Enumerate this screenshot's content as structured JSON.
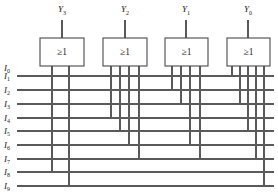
{
  "diagram": {
    "gate_symbol": "≥1",
    "wire_color": "#5a5a5a",
    "gate_border_color": "#4a4a4a",
    "background_color": "#ffffff",
    "outputs": [
      {
        "name": "Y3",
        "base": "Y",
        "sub": "3",
        "x": 62,
        "label_x": 62,
        "label_y": 12
      },
      {
        "name": "Y2",
        "base": "Y",
        "sub": "2",
        "x": 125,
        "label_x": 125,
        "label_y": 12
      },
      {
        "name": "Y1",
        "base": "Y",
        "sub": "1",
        "x": 186,
        "label_x": 186,
        "label_y": 12
      },
      {
        "name": "Y0",
        "base": "Y",
        "sub": "0",
        "x": 248,
        "label_x": 248,
        "label_y": 12
      }
    ],
    "inputs": [
      {
        "name": "I0",
        "base": "I",
        "sub": "0",
        "y": 68,
        "has_bus": false
      },
      {
        "name": "I1",
        "base": "I",
        "sub": "1",
        "y": 76,
        "has_bus": true
      },
      {
        "name": "I2",
        "base": "I",
        "sub": "2",
        "y": 90,
        "has_bus": true
      },
      {
        "name": "I3",
        "base": "I",
        "sub": "3",
        "y": 104,
        "has_bus": true
      },
      {
        "name": "I4",
        "base": "I",
        "sub": "4",
        "y": 118,
        "has_bus": true
      },
      {
        "name": "I5",
        "base": "I",
        "sub": "5",
        "y": 131,
        "has_bus": true
      },
      {
        "name": "I6",
        "base": "I",
        "sub": "6",
        "y": 145,
        "has_bus": true
      },
      {
        "name": "I7",
        "base": "I",
        "sub": "7",
        "y": 159,
        "has_bus": true
      },
      {
        "name": "I8",
        "base": "I",
        "sub": "8",
        "y": 172,
        "has_bus": true
      },
      {
        "name": "I9",
        "base": "I",
        "sub": "9",
        "y": 186,
        "has_bus": true
      }
    ],
    "gates": [
      {
        "id": "gate-y3",
        "output": "Y3",
        "box": {
          "x": 40,
          "y": 38,
          "w": 44,
          "h": 28
        },
        "out_stem": {
          "x": 62,
          "from_y": 20,
          "to_y": 38
        },
        "connections": [
          {
            "x": 52,
            "input": "I8",
            "to_y": 172
          },
          {
            "x": 69,
            "input": "I9",
            "to_y": 186
          }
        ]
      },
      {
        "id": "gate-y2",
        "output": "Y2",
        "box": {
          "x": 103,
          "y": 38,
          "w": 44,
          "h": 28
        },
        "out_stem": {
          "x": 125,
          "from_y": 20,
          "to_y": 38
        },
        "connections": [
          {
            "x": 111,
            "input": "I4",
            "to_y": 118
          },
          {
            "x": 120,
            "input": "I5",
            "to_y": 131
          },
          {
            "x": 129,
            "input": "I6",
            "to_y": 145
          },
          {
            "x": 139,
            "input": "I7",
            "to_y": 159
          }
        ]
      },
      {
        "id": "gate-y1",
        "output": "Y1",
        "box": {
          "x": 165,
          "y": 38,
          "w": 43,
          "h": 28
        },
        "out_stem": {
          "x": 186,
          "from_y": 20,
          "to_y": 38
        },
        "connections": [
          {
            "x": 172,
            "input": "I2",
            "to_y": 90
          },
          {
            "x": 181,
            "input": "I3",
            "to_y": 104
          },
          {
            "x": 190,
            "input": "I6",
            "to_y": 145
          },
          {
            "x": 200,
            "input": "I7",
            "to_y": 159
          }
        ]
      },
      {
        "id": "gate-y0",
        "output": "Y0",
        "box": {
          "x": 227,
          "y": 38,
          "w": 43,
          "h": 28
        },
        "out_stem": {
          "x": 248,
          "from_y": 20,
          "to_y": 38
        },
        "connections": [
          {
            "x": 232,
            "input": "I1",
            "to_y": 76
          },
          {
            "x": 240,
            "input": "I3",
            "to_y": 104
          },
          {
            "x": 248,
            "input": "I5",
            "to_y": 131
          },
          {
            "x": 256,
            "input": "I7",
            "to_y": 159
          },
          {
            "x": 264,
            "input": "I9",
            "to_y": 186
          }
        ]
      }
    ],
    "bus": {
      "x_start": 17,
      "x_end": 274
    }
  }
}
